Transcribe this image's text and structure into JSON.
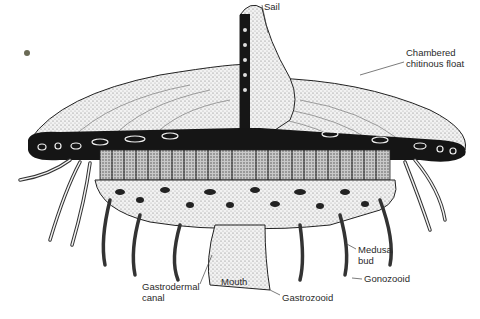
{
  "figure": {
    "colors": {
      "background": "#ffffff",
      "ink": "#1a1a1a",
      "stipple": "#bdbdbd",
      "float": "#e2e2e2",
      "dark_band": "#141414"
    },
    "labels": [
      {
        "id": "sail",
        "text": "Sail",
        "x": 262,
        "y": 0
      },
      {
        "id": "float_1",
        "text": "Chambered",
        "x": 406,
        "y": 48
      },
      {
        "id": "float_2",
        "text": "chitinous float",
        "x": 406,
        "y": 59
      },
      {
        "id": "medusa_1",
        "text": "Medusa",
        "x": 358,
        "y": 245
      },
      {
        "id": "medusa_2",
        "text": "bud",
        "x": 358,
        "y": 256
      },
      {
        "id": "gonozooid",
        "text": "Gonozooid",
        "x": 364,
        "y": 274
      },
      {
        "id": "gastrodermal_1",
        "text": "Gastrodermal",
        "x": 142,
        "y": 282
      },
      {
        "id": "gastrodermal_2",
        "text": "canal",
        "x": 142,
        "y": 293
      },
      {
        "id": "mouth",
        "text": "Mouth",
        "x": 221,
        "y": 277
      },
      {
        "id": "gastrozooid",
        "text": "Gastrozooid",
        "x": 282,
        "y": 293
      }
    ]
  }
}
